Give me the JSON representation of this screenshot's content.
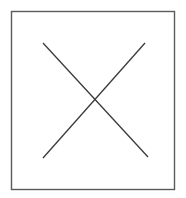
{
  "figure": {
    "canvas": {
      "width": 186,
      "height": 198,
      "background_color": "#ffffff"
    },
    "frame": {
      "name": "rectangular-border",
      "x": 11.5,
      "y": 11.5,
      "width": 163,
      "height": 178,
      "stroke_color": "#5a5a5a",
      "stroke_width": 1.4,
      "fill_color": "#ffffff"
    },
    "cross": {
      "name": "x-mark",
      "stroke_color": "#3a3a3a",
      "stroke_width": 1.3,
      "center_x": 95,
      "center_y": 100,
      "lines": [
        {
          "name": "diagonal-down-right",
          "x1": 43,
          "y1": 43,
          "x2": 148,
          "y2": 157
        },
        {
          "name": "diagonal-up-right",
          "x1": 43,
          "y1": 158,
          "x2": 145,
          "y2": 43
        }
      ]
    }
  }
}
